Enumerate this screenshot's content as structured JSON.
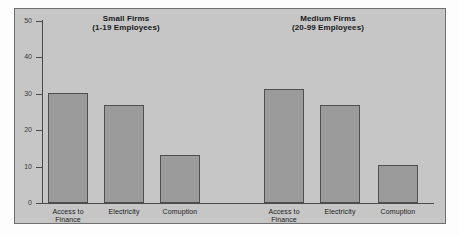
{
  "chart_data": {
    "type": "bar",
    "title": "",
    "xlabel": "",
    "ylabel": "",
    "ylim": [
      0,
      50
    ],
    "yticks": [
      0,
      10,
      20,
      30,
      40,
      50
    ],
    "grid": false,
    "legend": false,
    "panels": [
      {
        "title_line1": "Small Firms",
        "title_line2": "(1-19 Employees)",
        "categories": [
          "Access to Finance",
          "Electricity",
          "Comuption"
        ],
        "category_lines": [
          [
            "Access to",
            "Finance"
          ],
          [
            "Electricity",
            ""
          ],
          [
            "Comuption",
            ""
          ]
        ],
        "values": [
          30.2,
          27.0,
          13.2
        ]
      },
      {
        "title_line1": "Medium Firms",
        "title_line2": "(20-99 Employees)",
        "categories": [
          "Access to Finance",
          "Electricity",
          "Comuption"
        ],
        "category_lines": [
          [
            "Access to",
            "Finance"
          ],
          [
            "Electricity",
            ""
          ],
          [
            "Comuption",
            ""
          ]
        ],
        "values": [
          31.3,
          27.0,
          10.4
        ]
      }
    ],
    "colors": {
      "bar_fill": "#9b9b9b",
      "bar_edge": "#4f4f4f",
      "plot_background": "#c6c6c6",
      "axis": "#4a4a4a",
      "text": "#222222"
    }
  }
}
